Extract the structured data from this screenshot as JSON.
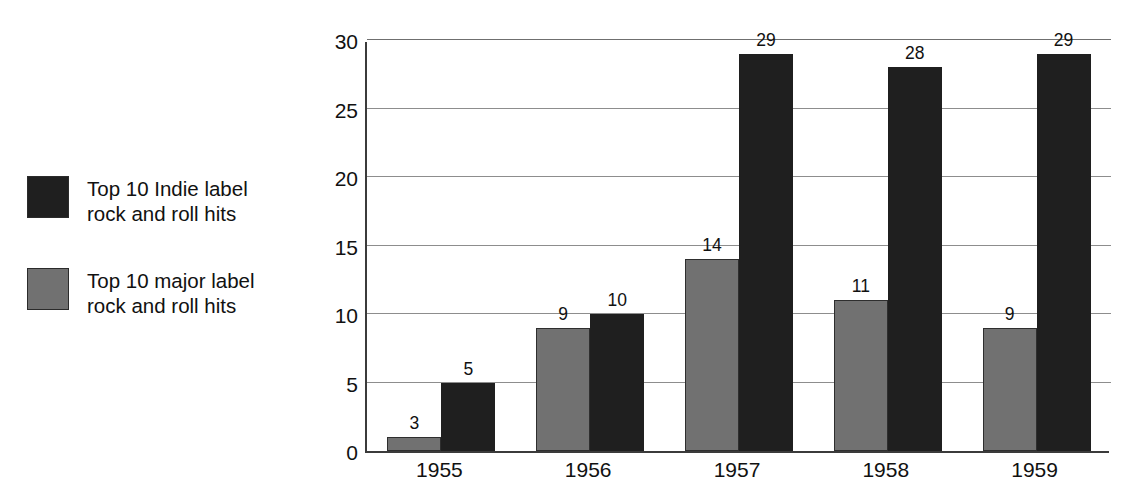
{
  "chart_data": {
    "type": "bar",
    "title": "",
    "subtitle": "",
    "xlabel": "",
    "ylabel": "",
    "categories": [
      "1955",
      "1956",
      "1957",
      "1958",
      "1959"
    ],
    "series": [
      {
        "name": "Top 10 major label\nrock and roll hits",
        "key": "major",
        "color": "#717171",
        "values": [
          3,
          9,
          14,
          11,
          9
        ],
        "plotted_heights": [
          1,
          9,
          14,
          11,
          9
        ]
      },
      {
        "name": "Top 10 Indie label\nrock and roll hits",
        "key": "indie",
        "color": "#1f1f1f",
        "values": [
          5,
          10,
          29,
          28,
          29
        ],
        "plotted_heights": [
          5,
          10,
          29,
          28,
          29
        ]
      }
    ],
    "ylim": [
      0,
      30
    ],
    "yticks": [
      0,
      5,
      10,
      15,
      20,
      25,
      30
    ],
    "ytick_labels": [
      "0",
      "5",
      "10",
      "15",
      "20",
      "25",
      "30"
    ],
    "grid": true,
    "grid_axis": "y",
    "legend_position": "left-outside",
    "bar_value_labels": true
  },
  "legend": {
    "entries": [
      {
        "label": "Top 10 Indie label\nrock and roll hits",
        "swatch": "indie"
      },
      {
        "label": "Top 10 major label\nrock and roll hits",
        "swatch": "major"
      }
    ]
  },
  "colors": {
    "indie": "#1f1f1f",
    "major": "#717171",
    "axis": "#3b3b3b",
    "grid": "#8d8d8d",
    "text": "#111111",
    "background": "#ffffff"
  }
}
